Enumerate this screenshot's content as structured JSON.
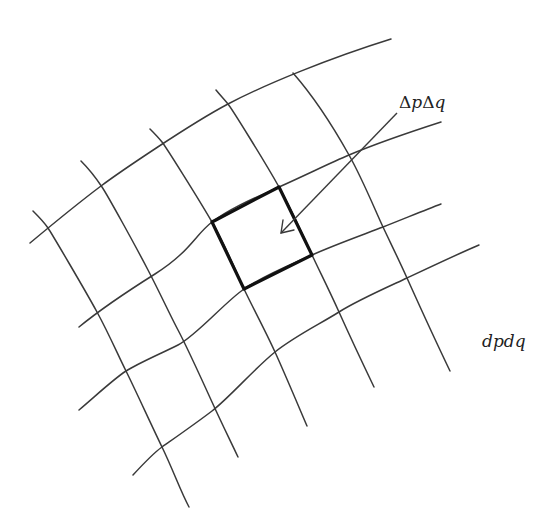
{
  "diagram": {
    "type": "curvilinear-coordinate-grid",
    "labels": {
      "area_element_discrete": {
        "delta1": "Δ",
        "var1": "p",
        "delta2": "Δ",
        "var2": "q"
      },
      "area_element_differential": "dpdq"
    },
    "colors": {
      "grid": "#3a3a3a",
      "highlight": "#111111",
      "background": "#ffffff"
    },
    "q_curves": [
      "M30,243 C60,218 85,198 101,186 S190,124 228,104 S330,58 391,39",
      "M79,327 C90,318 120,296 155,274 S195,235 212,222 S250,200 279,187 S330,163 349,155 S410,132 441,122",
      "M79,410 C100,392 115,378 126,371 S160,354 178,345 S225,302 244,289 S290,265 312,255 S365,234 383,227 S425,210 441,204",
      "M133,475 C145,462 155,452 162,447 S195,424 212,411 S255,368 275,352 S320,324 339,312 S390,286 407,278 S460,253 479,245"
    ],
    "p_curves": [
      "M33,211 C40,218 44,222 48,228 S85,290 97,312 S118,355 126,371 S150,422 162,447 S180,490 189,507",
      "M81,161 C90,170 96,178 102,187 S135,245 148,270 S170,315 178,330 S202,380 212,402 S230,440 238,457",
      "M150,129 C155,134 158,137 162,142 S198,198 212,222 S236,272 244,289 S265,330 275,352 S298,405 307,426",
      "M216,90 C220,95 224,99 228,104 S265,162 279,187 S304,238 312,255 S330,292 339,312 S362,362 374,387",
      "M293,73 C315,98 335,130 349,155 S375,210 383,227 S398,258 407,278 S438,346 450,371"
    ],
    "highlighted_cell": {
      "points": "212,222 279,187 312,255 244,289"
    },
    "arrow": {
      "from": [
        397,
        113
      ],
      "to": [
        281,
        233
      ]
    }
  }
}
